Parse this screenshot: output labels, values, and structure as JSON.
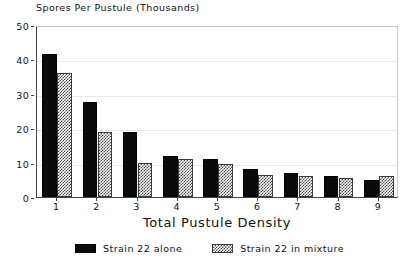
{
  "chart_data": {
    "type": "bar",
    "title": "Spores Per Pustule (Thousands)",
    "xlabel": "Total Pustule Density",
    "ylabel": "",
    "categories": [
      "1",
      "2",
      "3",
      "4",
      "5",
      "6",
      "7",
      "8",
      "9"
    ],
    "series": [
      {
        "name": "Strain 22 alone",
        "style": "solid-black",
        "color": "#0a0a0a",
        "values": [
          41.5,
          27.5,
          19.0,
          12.0,
          11.0,
          8.0,
          7.0,
          6.0,
          5.0
        ]
      },
      {
        "name": "Strain 22 in mixture",
        "style": "checkered-hatch",
        "color": "#ffffff",
        "values": [
          36.0,
          19.0,
          10.0,
          11.0,
          9.5,
          6.5,
          6.0,
          5.5,
          6.0
        ]
      }
    ],
    "ylim": [
      0,
      50
    ],
    "ytick_values": [
      0,
      10,
      20,
      30,
      40,
      50
    ],
    "ytick_labels": [
      "0",
      "10",
      "20",
      "30",
      "40",
      "50"
    ],
    "xtick_labels": [
      "1",
      "2",
      "3",
      "4",
      "5",
      "6",
      "7",
      "8",
      "9"
    ],
    "grid": true,
    "grid_orientation": "horizontal",
    "legend_position": "bottom-center"
  },
  "legend": {
    "entries": [
      {
        "label": "Strain 22 alone"
      },
      {
        "label": "Strain 22 in mixture"
      }
    ]
  }
}
